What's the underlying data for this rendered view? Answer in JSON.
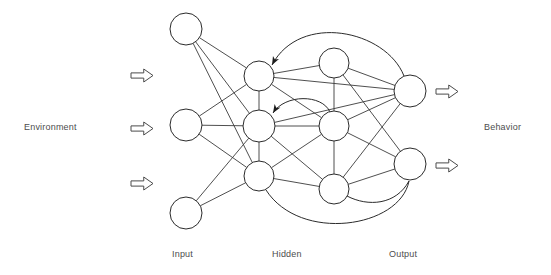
{
  "diagram": {
    "background_color": "#ffffff",
    "stroke_color": "#2b2b2b",
    "node_fill": "#ffffff",
    "text_color": "#4d4d4d",
    "labels": {
      "environment": "Environment",
      "behavior": "Behavior",
      "input": "Input",
      "hidden": "Hidden",
      "output": "Output"
    },
    "layers": [
      {
        "id": "input",
        "label": "Input",
        "nodes": [
          {
            "id": "i1",
            "cx": 186,
            "cy": 29,
            "r": 16
          },
          {
            "id": "i2",
            "cx": 186,
            "cy": 125,
            "r": 16
          },
          {
            "id": "i3",
            "cx": 186,
            "cy": 213,
            "r": 16
          }
        ]
      },
      {
        "id": "hidden",
        "label": "Hidden",
        "nodes": [
          {
            "id": "h1",
            "cx": 259,
            "cy": 76,
            "r": 15
          },
          {
            "id": "h2",
            "cx": 259,
            "cy": 126,
            "r": 16
          },
          {
            "id": "h3",
            "cx": 259,
            "cy": 176,
            "r": 15
          },
          {
            "id": "h4",
            "cx": 334,
            "cy": 63,
            "r": 15
          },
          {
            "id": "h5",
            "cx": 334,
            "cy": 126,
            "r": 15
          },
          {
            "id": "h6",
            "cx": 334,
            "cy": 189,
            "r": 15
          }
        ]
      },
      {
        "id": "output",
        "label": "Output",
        "nodes": [
          {
            "id": "o1",
            "cx": 410,
            "cy": 91,
            "r": 16
          },
          {
            "id": "o2",
            "cx": 410,
            "cy": 164,
            "r": 16
          }
        ]
      }
    ],
    "edges": [
      {
        "from": "i1",
        "to": "h1"
      },
      {
        "from": "i1",
        "to": "h2"
      },
      {
        "from": "i1",
        "to": "h3"
      },
      {
        "from": "i2",
        "to": "h1"
      },
      {
        "from": "i2",
        "to": "h2"
      },
      {
        "from": "i2",
        "to": "h3"
      },
      {
        "from": "i3",
        "to": "h2"
      },
      {
        "from": "i3",
        "to": "h3"
      },
      {
        "from": "h1",
        "to": "h2"
      },
      {
        "from": "h2",
        "to": "h3"
      },
      {
        "from": "h1",
        "to": "h4"
      },
      {
        "from": "h1",
        "to": "h5"
      },
      {
        "from": "h4",
        "to": "h5"
      },
      {
        "from": "h5",
        "to": "h6"
      },
      {
        "from": "h2",
        "to": "h5"
      },
      {
        "from": "h2",
        "to": "h6"
      },
      {
        "from": "h3",
        "to": "h5"
      },
      {
        "from": "h3",
        "to": "h6"
      },
      {
        "from": "h1",
        "to": "o1"
      },
      {
        "from": "h4",
        "to": "o1"
      },
      {
        "from": "h4",
        "to": "o2"
      },
      {
        "from": "h5",
        "to": "o1"
      },
      {
        "from": "h5",
        "to": "o2"
      },
      {
        "from": "h6",
        "to": "o1"
      },
      {
        "from": "h6",
        "to": "o2"
      },
      {
        "from": "h2",
        "to": "o1"
      }
    ],
    "recurrent_edges": [
      {
        "id": "rec-top",
        "from": "o1",
        "to": "h1",
        "path": "M 404 76 C 386 30 300 12 272 65",
        "arrow_at": [
          272,
          65
        ],
        "arrow_angle": 118
      },
      {
        "id": "rec-middle",
        "from": "h5",
        "to": "h2",
        "path": "M 330 112 C 322 94 285 94 273 113",
        "arrow_at": [
          273,
          113
        ],
        "arrow_angle": 122
      },
      {
        "id": "rec-bottom-long",
        "from": "o2",
        "to": "h3",
        "path": "M 409 181 C 400 228 300 243 266 190",
        "arrow_at": [
          266,
          190
        ],
        "arrow_angle": 57
      },
      {
        "id": "rec-bottom-short",
        "from": "o2",
        "to": "h6",
        "path": "M 409 181 C 396 205 368 207 347 196",
        "arrow_at": [
          347,
          196
        ],
        "arrow_angle": 28
      }
    ],
    "io_arrows": [
      {
        "id": "env-arrow-1",
        "x": 131,
        "y": 69,
        "w": 22,
        "h": 13,
        "direction": "right"
      },
      {
        "id": "env-arrow-2",
        "x": 131,
        "y": 122,
        "w": 22,
        "h": 13,
        "direction": "right"
      },
      {
        "id": "env-arrow-3",
        "x": 131,
        "y": 177,
        "w": 22,
        "h": 13,
        "direction": "right"
      },
      {
        "id": "beh-arrow-1",
        "x": 436,
        "y": 85,
        "w": 22,
        "h": 13,
        "direction": "right"
      },
      {
        "id": "beh-arrow-2",
        "x": 436,
        "y": 159,
        "w": 22,
        "h": 13,
        "direction": "right"
      }
    ]
  }
}
